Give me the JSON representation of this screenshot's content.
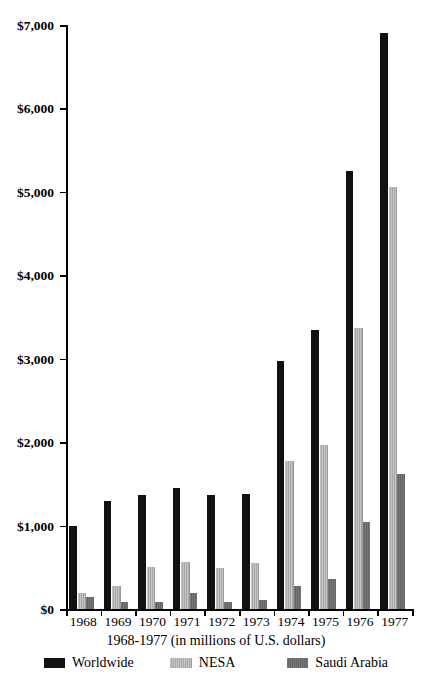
{
  "chart_data": {
    "type": "bar",
    "title": "",
    "xlabel": "1968-1977 (in millions of U.S. dollars)",
    "ylabel": "",
    "categories": [
      "1968",
      "1969",
      "1970",
      "1971",
      "1972",
      "1973",
      "1974",
      "1975",
      "1976",
      "1977"
    ],
    "ylim": [
      0,
      7000
    ],
    "ytick_values": [
      0,
      1000,
      2000,
      3000,
      4000,
      5000,
      6000,
      7000
    ],
    "ytick_labels": [
      "$0",
      "$1,000",
      "$2,000",
      "$3,000",
      "$4,000",
      "$5,000",
      "$6,000",
      "$7,000"
    ],
    "grid": false,
    "legend_position": "bottom",
    "series": [
      {
        "name": "Worldwide",
        "color": "#111111",
        "values": [
          1000,
          1290,
          1370,
          1450,
          1370,
          1380,
          2970,
          3340,
          5250,
          6900
        ]
      },
      {
        "name": "NESA",
        "color": "#b9b9b9",
        "values": [
          190,
          270,
          500,
          560,
          490,
          550,
          1780,
          1970,
          3370,
          5060
        ]
      },
      {
        "name": "Saudi Arabia",
        "color": "#6e6e6e",
        "values": [
          150,
          80,
          90,
          190,
          90,
          110,
          270,
          360,
          1040,
          1620
        ]
      }
    ]
  },
  "legend": {
    "items": [
      {
        "label": "Worldwide"
      },
      {
        "label": "NESA"
      },
      {
        "label": "Saudi Arabia"
      }
    ]
  }
}
